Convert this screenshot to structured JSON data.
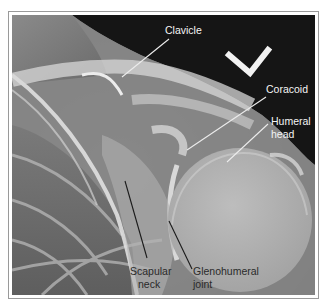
{
  "figure": {
    "type": "Shoulder radiograph (AP view)",
    "labels": [
      {
        "id": "clavicle",
        "text": "Clavicle",
        "color": "#f4f4f4"
      },
      {
        "id": "coracoid",
        "text": "Coracoid",
        "color": "#f4f4f4"
      },
      {
        "id": "humeral_head_1",
        "text": "Humeral",
        "color": "#f4f4f4"
      },
      {
        "id": "humeral_head_2",
        "text": "head",
        "color": "#f4f4f4"
      },
      {
        "id": "scapular_neck_1",
        "text": "Scapular",
        "color": "#2a2a2a"
      },
      {
        "id": "scapular_neck_2",
        "text": "neck",
        "color": "#2a2a2a"
      },
      {
        "id": "glenohumeral_1",
        "text": "Glenohumeral",
        "color": "#2a2a2a"
      },
      {
        "id": "glenohumeral_2",
        "text": "joint",
        "color": "#2a2a2a"
      }
    ],
    "marker": "L-shaped orientation marker (check/chevron)"
  }
}
